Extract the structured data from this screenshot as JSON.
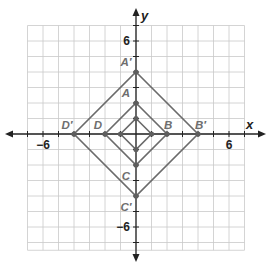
{
  "figure": {
    "type": "coordinate-plane-dilation",
    "axes": {
      "x_label": "x",
      "y_label": "y",
      "x_range": [
        -7,
        7
      ],
      "y_range": [
        -7.5,
        7
      ],
      "tick_labels": [
        {
          "axis": "x",
          "value": -6,
          "text": "−6"
        },
        {
          "axis": "x",
          "value": 6,
          "text": "6"
        },
        {
          "axis": "y",
          "value": 6,
          "text": "6"
        },
        {
          "axis": "y",
          "value": -6,
          "text": "−6"
        }
      ],
      "grid": true,
      "grid_step": 1
    },
    "shapes": [
      {
        "name": "small-square",
        "labeled": false,
        "vertices": [
          {
            "label": "",
            "x": 0,
            "y": 1
          },
          {
            "label": "",
            "x": 1,
            "y": 0
          },
          {
            "label": "",
            "x": 0,
            "y": -1
          },
          {
            "label": "",
            "x": -1,
            "y": 0
          }
        ]
      },
      {
        "name": "square-ABCD",
        "labeled": true,
        "vertices": [
          {
            "label": "A",
            "x": 0,
            "y": 2
          },
          {
            "label": "B",
            "x": 2,
            "y": 0
          },
          {
            "label": "C",
            "x": 0,
            "y": -2
          },
          {
            "label": "D",
            "x": -2,
            "y": 0
          }
        ]
      },
      {
        "name": "square-A'B'C'D'",
        "labeled": true,
        "vertices": [
          {
            "label": "A′",
            "x": 0,
            "y": 4
          },
          {
            "label": "B′",
            "x": 4,
            "y": 0
          },
          {
            "label": "C′",
            "x": 0,
            "y": -4
          },
          {
            "label": "D′",
            "x": -4,
            "y": 0
          }
        ]
      }
    ],
    "colors": {
      "grid": "#c9c9c9",
      "axis": "#222222",
      "shape_stroke": "#6b6b6b",
      "vertex": "#5e5e5e",
      "label": "#6e6e6e"
    }
  }
}
